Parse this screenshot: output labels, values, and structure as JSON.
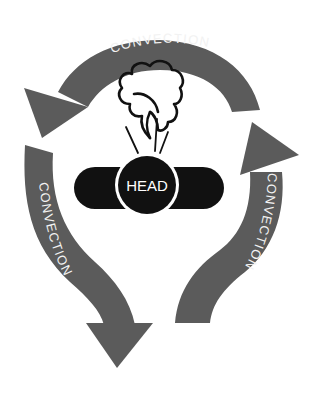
{
  "diagram": {
    "arrows": [
      {
        "id": "top",
        "label": "CONVECTION",
        "direction": "counter-clockwise, pointing down-left"
      },
      {
        "id": "left",
        "label": "CONVECTION",
        "direction": "down"
      },
      {
        "id": "right",
        "label": "CONVECTION",
        "direction": "up"
      }
    ],
    "center": {
      "label": "HEAD"
    },
    "icons": {
      "cloud": "steam-cloud-icon",
      "steam_lines": "heat-rising-lines"
    },
    "colors": {
      "arrow": "#5b5b5b",
      "head": "#111111",
      "label_text": "#f2f2f2",
      "background": "#ffffff"
    }
  }
}
